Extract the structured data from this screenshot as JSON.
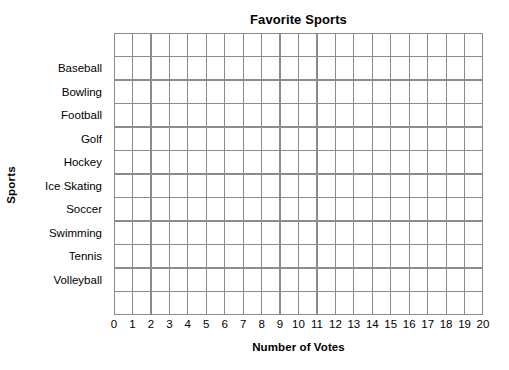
{
  "chart_data": {
    "type": "bar",
    "orientation": "horizontal",
    "title": "Favorite Sports",
    "xlabel": "Number of Votes",
    "ylabel": "Sports",
    "categories": [
      "Baseball",
      "Bowling",
      "Football",
      "Golf",
      "Hockey",
      "Ice Skating",
      "Soccer",
      "Swimming",
      "Tennis",
      "Volleyball"
    ],
    "values": [
      0,
      0,
      0,
      0,
      0,
      0,
      0,
      0,
      0,
      0
    ],
    "xticks": [
      "0",
      "1",
      "2",
      "3",
      "4",
      "5",
      "6",
      "7",
      "8",
      "9",
      "10",
      "11",
      "12",
      "13",
      "14",
      "15",
      "16",
      "17",
      "18",
      "19",
      "20"
    ],
    "xlim": [
      0,
      20
    ],
    "xtick_step": 1,
    "grid": true,
    "grid_columns": 20,
    "grid_rows": 12,
    "legend": null,
    "annotations": [],
    "note": "Blank grid worksheet: no bars are drawn; all category values are empty."
  },
  "style": {
    "grid_line_color": "#8c8c8c",
    "plot_background": "#ffffff",
    "text_color": "#000000",
    "page_background": "#ffffff"
  }
}
